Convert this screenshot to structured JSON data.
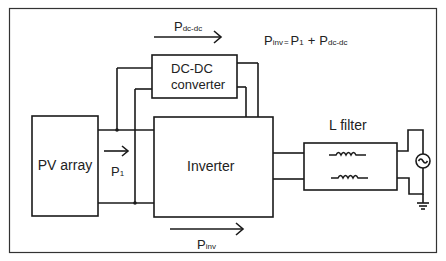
{
  "diagram": {
    "blocks": {
      "pv_array": {
        "label": "PV array"
      },
      "dcdc": {
        "label_line1": "DC-DC",
        "label_line2": "converter"
      },
      "inverter": {
        "label": "Inverter"
      },
      "l_filter": {
        "label": "L filter"
      },
      "grid": {
        "label": "AC grid source"
      }
    },
    "power_labels": {
      "p_dcdc": {
        "main": "P",
        "sub": "dc-dc"
      },
      "p1": {
        "main": "P",
        "sub": "1"
      },
      "p_inv": {
        "main": "P",
        "sub": "inv"
      }
    },
    "equation": {
      "lhs_main": "P",
      "lhs_sub": "inv",
      "equals": "=",
      "term1_main": "P",
      "term1_sub": "1",
      "plus": "+",
      "term2_main": "P",
      "term2_sub": "dc-dc"
    },
    "colors": {
      "line": "#1a1a1a",
      "text": "#222222",
      "background": "#ffffff"
    }
  }
}
